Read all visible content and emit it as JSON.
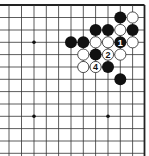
{
  "diagram": {
    "type": "go-board-fragment",
    "grid": {
      "x_lines": [
        9,
        21.5,
        34,
        46.3,
        58.6,
        71,
        83.3,
        95.6,
        108,
        120.3,
        132.6,
        144.5
      ],
      "y_lines": [
        5,
        17.5,
        30,
        42.3,
        54.6,
        67,
        79.3,
        91.6,
        104,
        116.3,
        128.6,
        141,
        153.3
      ],
      "top_edge": true,
      "right_edge": true,
      "line_color": "#333333",
      "edge_color": "#222222"
    },
    "star_points": [
      {
        "col": 2,
        "row": 3
      },
      {
        "col": 2,
        "row": 9
      },
      {
        "col": 8,
        "row": 9
      }
    ],
    "stones": [
      {
        "color": "black",
        "col": 9,
        "row": 1,
        "label": ""
      },
      {
        "color": "white",
        "col": 10,
        "row": 1,
        "label": ""
      },
      {
        "color": "black",
        "col": 7,
        "row": 2,
        "label": ""
      },
      {
        "color": "black",
        "col": 8,
        "row": 2,
        "label": ""
      },
      {
        "color": "white",
        "col": 9,
        "row": 2,
        "label": ""
      },
      {
        "color": "black",
        "col": 10,
        "row": 2,
        "label": ""
      },
      {
        "color": "black",
        "col": 5,
        "row": 3,
        "label": ""
      },
      {
        "color": "black",
        "col": 6,
        "row": 3,
        "label": ""
      },
      {
        "color": "white",
        "col": 7,
        "row": 3,
        "label": ""
      },
      {
        "color": "white",
        "col": 8,
        "row": 3,
        "label": ""
      },
      {
        "color": "black",
        "col": 9,
        "row": 3,
        "label": "1"
      },
      {
        "color": "white",
        "col": 10,
        "row": 3,
        "label": ""
      },
      {
        "color": "white",
        "col": 6,
        "row": 4,
        "label": ""
      },
      {
        "color": "black",
        "col": 7,
        "row": 4,
        "label": ""
      },
      {
        "color": "white",
        "col": 8,
        "row": 4,
        "label": "2"
      },
      {
        "color": "white",
        "col": 9,
        "row": 4,
        "label": ""
      },
      {
        "color": "white",
        "col": 6,
        "row": 5,
        "label": ""
      },
      {
        "color": "white",
        "col": 7,
        "row": 5,
        "label": "4"
      },
      {
        "color": "black",
        "col": 8,
        "row": 5,
        "label": ""
      },
      {
        "color": "black",
        "col": 9,
        "row": 6,
        "label": ""
      }
    ],
    "colors": {
      "black_stone": "#111111",
      "white_stone": "#ffffff",
      "white_stone_outline": "#222222",
      "label_on_black": "#ffffff",
      "label_on_white": "#111111"
    }
  }
}
